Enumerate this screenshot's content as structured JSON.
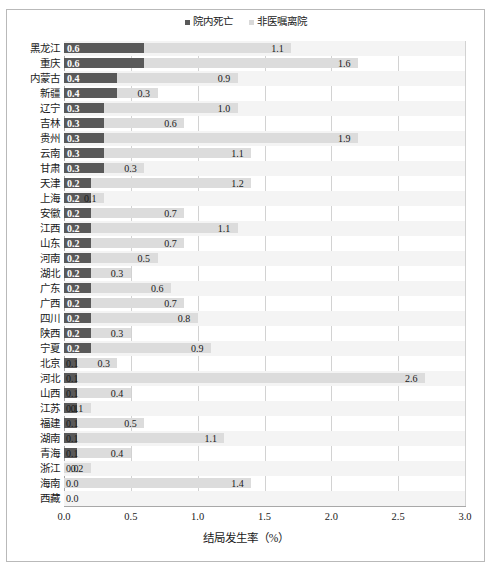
{
  "chart_data": {
    "type": "bar",
    "orientation": "horizontal",
    "stacked": true,
    "title": "",
    "xlabel": "结局发生率（%）",
    "ylabel": "",
    "xlim": [
      0.0,
      3.0
    ],
    "xticks": [
      "0.0",
      "0.5",
      "1.0",
      "1.5",
      "2.0",
      "2.5",
      "3.0"
    ],
    "xtick_values": [
      0.0,
      0.5,
      1.0,
      1.5,
      2.0,
      2.5,
      3.0
    ],
    "grid": true,
    "legend_position": "top-center",
    "categories": [
      "黑龙江",
      "重庆",
      "内蒙古",
      "新疆",
      "辽宁",
      "吉林",
      "贵州",
      "云南",
      "甘肃",
      "天津",
      "上海",
      "安徽",
      "江西",
      "山东",
      "河南",
      "湖北",
      "广东",
      "广西",
      "四川",
      "陕西",
      "宁夏",
      "北京",
      "河北",
      "山西",
      "江苏",
      "福建",
      "湖南",
      "青海",
      "浙江",
      "海南",
      "西藏"
    ],
    "series": [
      {
        "name": "院内死亡",
        "color": "#595959",
        "values": [
          0.6,
          0.6,
          0.4,
          0.4,
          0.3,
          0.3,
          0.3,
          0.3,
          0.3,
          0.2,
          0.2,
          0.2,
          0.2,
          0.2,
          0.2,
          0.2,
          0.2,
          0.2,
          0.2,
          0.2,
          0.2,
          0.1,
          0.1,
          0.1,
          0.1,
          0.1,
          0.1,
          0.1,
          0.0,
          0.0,
          0.0
        ],
        "labels": [
          "0.6",
          "0.6",
          "0.4",
          "0.4",
          "0.3",
          "0.3",
          "0.3",
          "0.3",
          "0.3",
          "0.2",
          "0.2",
          "0.2",
          "0.2",
          "0.2",
          "0.2",
          "0.2",
          "0.2",
          "0.2",
          "0.2",
          "0.2",
          "0.2",
          "0.1",
          "0.1",
          "0.1",
          "0.1",
          "0.1",
          "0.1",
          "0.1",
          "0.0",
          "0.0",
          "0.0"
        ]
      },
      {
        "name": "非医嘱离院",
        "color": "#dcdcdc",
        "values": [
          1.1,
          1.6,
          0.9,
          0.3,
          1.0,
          0.6,
          1.9,
          1.1,
          0.3,
          1.2,
          0.1,
          0.7,
          1.1,
          0.7,
          0.5,
          0.3,
          0.6,
          0.7,
          0.8,
          0.3,
          0.9,
          0.3,
          2.6,
          0.4,
          0.1,
          0.5,
          1.1,
          0.4,
          0.2,
          1.4,
          0.0
        ],
        "labels": [
          "1.1",
          "1.6",
          "0.9",
          "0.3",
          "1.0",
          "0.6",
          "1.9",
          "1.1",
          "0.3",
          "1.2",
          "0.1",
          "0.7",
          "1.1",
          "0.7",
          "0.5",
          "0.3",
          "0.6",
          "0.7",
          "0.8",
          "0.3",
          "0.9",
          "0.3",
          "2.6",
          "0.4",
          "0.1",
          "0.5",
          "1.1",
          "0.4",
          "0.2",
          "1.4",
          ""
        ]
      }
    ]
  },
  "legend": {
    "items": [
      {
        "label": "院内死亡",
        "color": "#595959"
      },
      {
        "label": "非医嘱离院",
        "color": "#dcdcdc"
      }
    ]
  }
}
